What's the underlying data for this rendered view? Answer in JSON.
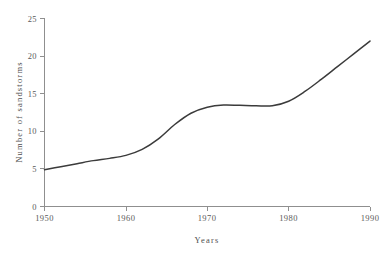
{
  "chart_data": {
    "type": "line",
    "title": "",
    "xlabel": "Years",
    "ylabel": "Number of sandstorms",
    "xlim": [
      1950,
      1990
    ],
    "ylim": [
      0,
      25
    ],
    "grid": false,
    "legend": false,
    "x_ticks": [
      "1950",
      "1960",
      "1970",
      "1980",
      "1990"
    ],
    "y_ticks": [
      "0",
      "5",
      "10",
      "15",
      "20",
      "25"
    ],
    "series": [
      {
        "name": "Number of sandstorms",
        "color": "#3b3b3b",
        "x": [
          1950,
          1952,
          1954,
          1956,
          1958,
          1960,
          1962,
          1964,
          1966,
          1968,
          1970,
          1972,
          1974,
          1976,
          1978,
          1980,
          1982,
          1984,
          1986,
          1988,
          1990
        ],
        "values": [
          4.9,
          5.3,
          5.7,
          6.1,
          6.4,
          6.8,
          7.6,
          9.0,
          10.9,
          12.4,
          13.2,
          13.5,
          13.45,
          13.4,
          13.4,
          14.0,
          15.3,
          16.9,
          18.6,
          20.3,
          22.0
        ]
      }
    ],
    "axis_color": "#8f8f8f",
    "background": "#ffffff"
  },
  "labels": {
    "y_axis_title": "Number of sandstorms",
    "x_axis_title": "Years",
    "y_0": "0",
    "y_5": "5",
    "y_10": "10",
    "y_15": "15",
    "y_20": "20",
    "y_25": "25",
    "x_1950": "1950",
    "x_1960": "1960",
    "x_1970": "1970",
    "x_1980": "1980",
    "x_1990": "1990"
  }
}
